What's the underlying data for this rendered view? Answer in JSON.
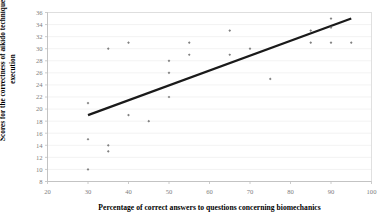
{
  "chart_data": {
    "type": "scatter",
    "title": "",
    "xlabel": "Percentage of correct answers to questions concerning biomechanics",
    "ylabel": "Scores for the correctness of aikido techniques execution",
    "xlim": [
      20,
      100
    ],
    "ylim": [
      8,
      36
    ],
    "xticks": [
      20,
      30,
      40,
      50,
      60,
      70,
      80,
      90,
      100
    ],
    "yticks": [
      8,
      10,
      12,
      14,
      16,
      18,
      20,
      22,
      24,
      26,
      28,
      30,
      32,
      34,
      36
    ],
    "grid": "horizontal",
    "legend": "none",
    "marker": "small-gray-diamond",
    "marker_color": "#808080",
    "trendline": {
      "visible": true,
      "color": "#1a1a1a",
      "width": 2.2,
      "x_start": 30,
      "y_start": 19,
      "x_end": 95,
      "y_end": 35
    },
    "points": [
      {
        "x": 30,
        "y": 21
      },
      {
        "x": 30,
        "y": 15
      },
      {
        "x": 30,
        "y": 10
      },
      {
        "x": 35,
        "y": 30
      },
      {
        "x": 35,
        "y": 14
      },
      {
        "x": 35,
        "y": 13
      },
      {
        "x": 40,
        "y": 31
      },
      {
        "x": 40,
        "y": 19
      },
      {
        "x": 45,
        "y": 18
      },
      {
        "x": 50,
        "y": 28
      },
      {
        "x": 50,
        "y": 26
      },
      {
        "x": 50,
        "y": 22
      },
      {
        "x": 55,
        "y": 31
      },
      {
        "x": 55,
        "y": 29
      },
      {
        "x": 65,
        "y": 33
      },
      {
        "x": 65,
        "y": 29
      },
      {
        "x": 70,
        "y": 30
      },
      {
        "x": 75,
        "y": 25
      },
      {
        "x": 85,
        "y": 33
      },
      {
        "x": 85,
        "y": 31
      },
      {
        "x": 90,
        "y": 35
      },
      {
        "x": 90,
        "y": 33.5
      },
      {
        "x": 90,
        "y": 31
      },
      {
        "x": 95,
        "y": 31
      }
    ]
  },
  "axis": {
    "x_tick_labels": [
      "20",
      "30",
      "40",
      "50",
      "60",
      "70",
      "80",
      "90",
      "100"
    ],
    "y_tick_labels": [
      "8",
      "10",
      "12",
      "14",
      "16",
      "18",
      "20",
      "22",
      "24",
      "26",
      "28",
      "30",
      "32",
      "34",
      "36"
    ]
  },
  "colors": {
    "marker": "#808080",
    "trendline": "#1a1a1a",
    "grid": "#ededed",
    "axis": "#d9d9d9",
    "tick_text": "#808080",
    "label_text": "#000000",
    "background": "#ffffff"
  }
}
